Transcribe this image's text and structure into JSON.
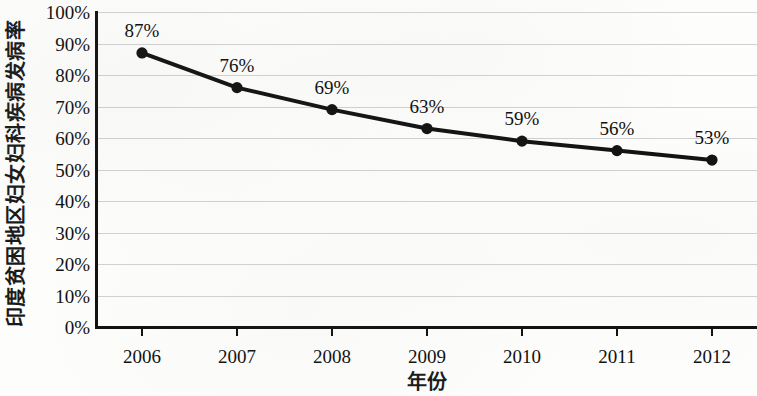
{
  "chart_data": {
    "type": "line",
    "title": "",
    "xlabel": "年份",
    "ylabel": "印度贫困地区妇女妇科疾病发病率",
    "categories": [
      "2006",
      "2007",
      "2008",
      "2009",
      "2010",
      "2011",
      "2012"
    ],
    "values": [
      87,
      76,
      69,
      63,
      59,
      56,
      53
    ],
    "point_labels": [
      "87%",
      "76%",
      "69%",
      "63%",
      "59%",
      "56%",
      "53%"
    ],
    "ylim": [
      0,
      100
    ],
    "y_ticks": [
      0,
      10,
      20,
      30,
      40,
      50,
      60,
      70,
      80,
      90,
      100
    ],
    "y_tick_labels": [
      "0%",
      "10%",
      "20%",
      "30%",
      "40%",
      "50%",
      "60%",
      "70%",
      "80%",
      "90%",
      "100%"
    ],
    "grid": true,
    "legend": false,
    "legend_position": "none",
    "series": [
      {
        "name": "印度贫困地区妇女妇科疾病发病率",
        "values": [
          87,
          76,
          69,
          63,
          59,
          56,
          53
        ],
        "color": "#111111",
        "marker": "circle"
      }
    ],
    "colors": {
      "line": "#111111",
      "marker": "#111111",
      "axis": "#111111",
      "gridline": "#c9c9c9",
      "background": "#fdfdfc",
      "text": "#101010"
    }
  }
}
